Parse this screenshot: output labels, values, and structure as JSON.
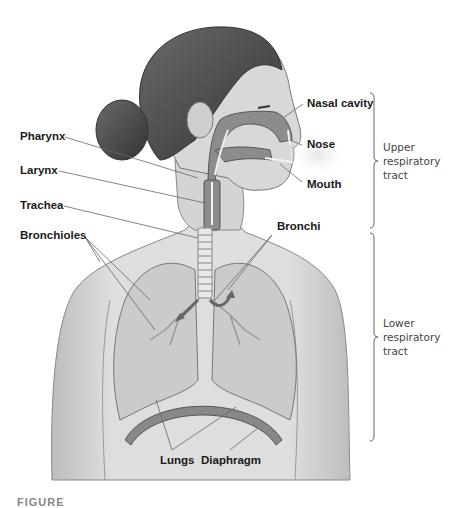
{
  "figure": {
    "type": "anatomical-diagram",
    "style": "grayscale illustration of female head and torso",
    "caption_partial": "FIGURE"
  },
  "labels": {
    "left": [
      {
        "id": "pharynx",
        "text": "Pharynx"
      },
      {
        "id": "larynx",
        "text": "Larynx"
      },
      {
        "id": "trachea",
        "text": "Trachea"
      },
      {
        "id": "bronchioles",
        "text": "Bronchioles"
      }
    ],
    "right": [
      {
        "id": "nasal_cavity",
        "text": "Nasal cavity"
      },
      {
        "id": "nose",
        "text": "Nose"
      },
      {
        "id": "mouth",
        "text": "Mouth"
      },
      {
        "id": "bronchi",
        "text": "Bronchi"
      }
    ],
    "bottom": [
      {
        "id": "lungs",
        "text": "Lungs"
      },
      {
        "id": "diaphragm",
        "text": "Diaphragm"
      }
    ]
  },
  "regions": {
    "upper": {
      "line1": "Upper",
      "line2": "respiratory",
      "line3": "tract"
    },
    "lower": {
      "line1": "Lower",
      "line2": "respiratory",
      "line3": "tract"
    }
  },
  "colors": {
    "skin": "#d9d9d9",
    "hair": "#4a4a4a",
    "airway": "#8a8a8a",
    "lung": "#c4c4c4",
    "outline": "#555555",
    "text": "#1a1a1a"
  }
}
